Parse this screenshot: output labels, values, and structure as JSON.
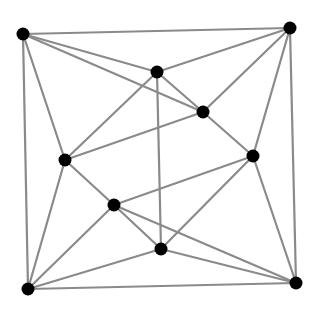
{
  "diagram": {
    "type": "graph",
    "background": "#ffffff",
    "edge_color": "#8a8a8a",
    "node_color": "#000000",
    "node_radius": 6.5,
    "nodes": [
      {
        "id": "A",
        "x": 23,
        "y": 34
      },
      {
        "id": "B",
        "x": 290,
        "y": 28
      },
      {
        "id": "C",
        "x": 157,
        "y": 72
      },
      {
        "id": "D",
        "x": 203,
        "y": 112
      },
      {
        "id": "E",
        "x": 65,
        "y": 160
      },
      {
        "id": "F",
        "x": 253,
        "y": 156
      },
      {
        "id": "G",
        "x": 114,
        "y": 205
      },
      {
        "id": "H",
        "x": 161,
        "y": 249
      },
      {
        "id": "I",
        "x": 28,
        "y": 289
      },
      {
        "id": "J",
        "x": 296,
        "y": 283
      }
    ],
    "edges": [
      [
        "A",
        "B"
      ],
      [
        "A",
        "I"
      ],
      [
        "A",
        "C"
      ],
      [
        "A",
        "D"
      ],
      [
        "A",
        "E"
      ],
      [
        "B",
        "C"
      ],
      [
        "B",
        "D"
      ],
      [
        "B",
        "F"
      ],
      [
        "B",
        "J"
      ],
      [
        "C",
        "E"
      ],
      [
        "C",
        "D"
      ],
      [
        "C",
        "H"
      ],
      [
        "D",
        "E"
      ],
      [
        "D",
        "F"
      ],
      [
        "E",
        "G"
      ],
      [
        "E",
        "I"
      ],
      [
        "F",
        "G"
      ],
      [
        "F",
        "H"
      ],
      [
        "F",
        "J"
      ],
      [
        "G",
        "H"
      ],
      [
        "G",
        "I"
      ],
      [
        "G",
        "J"
      ],
      [
        "H",
        "I"
      ],
      [
        "H",
        "J"
      ],
      [
        "I",
        "J"
      ]
    ]
  }
}
